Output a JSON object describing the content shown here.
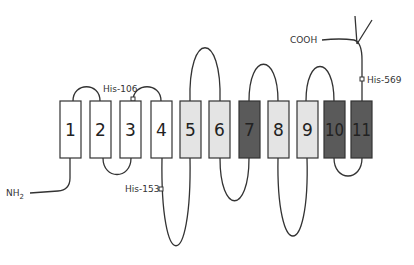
{
  "diagram": {
    "type": "membrane-topology",
    "colors": {
      "white": "#ffffff",
      "light": "#e4e4e4",
      "dark": "#5a5a5a",
      "stroke": "#333333"
    },
    "segments": [
      {
        "label": "1",
        "x": 60,
        "shade": "white"
      },
      {
        "label": "2",
        "x": 90,
        "shade": "white"
      },
      {
        "label": "3",
        "x": 120,
        "shade": "white"
      },
      {
        "label": "4",
        "x": 151,
        "shade": "white"
      },
      {
        "label": "5",
        "x": 180,
        "shade": "light"
      },
      {
        "label": "6",
        "x": 209,
        "shade": "light"
      },
      {
        "label": "7",
        "x": 239,
        "shade": "dark"
      },
      {
        "label": "8",
        "x": 268,
        "shade": "light"
      },
      {
        "label": "9",
        "x": 297,
        "shade": "light"
      },
      {
        "label": "10",
        "x": 324,
        "shade": "dark"
      },
      {
        "label": "11",
        "x": 351,
        "shade": "dark"
      }
    ],
    "terminals": {
      "n_terminus": "NH",
      "n_terminus_sub": "2",
      "c_terminus": "COOH"
    },
    "sites": [
      {
        "label": "His-106"
      },
      {
        "label": "His-153"
      },
      {
        "label": "His-569"
      }
    ]
  }
}
